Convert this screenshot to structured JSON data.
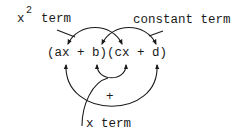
{
  "diagram": {
    "expression": "(ax + b)(cx + d)",
    "labels": {
      "x2_base": "x",
      "x2_exp": "2",
      "x2_word": "term",
      "constant": "constant term",
      "x_term": "x term",
      "plus": "+"
    },
    "colors": {
      "ink": "#1a1a1a",
      "background": "#ffffff"
    }
  }
}
